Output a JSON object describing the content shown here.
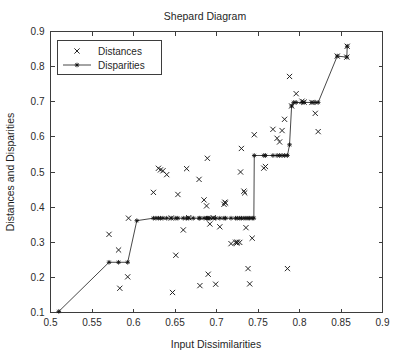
{
  "chart_data": {
    "type": "scatter",
    "title": "Shepard Diagram",
    "xlabel": "Input Dissimilarities",
    "ylabel": "Distances and Disparities",
    "xlim": [
      0.5,
      0.9
    ],
    "ylim": [
      0.1,
      0.9
    ],
    "xticks": [
      0.5,
      0.55,
      0.6,
      0.65,
      0.7,
      0.75,
      0.8,
      0.85,
      0.9
    ],
    "xtick_labels": [
      "0.5",
      "0.55",
      "0.6",
      "0.65",
      "0.7",
      "0.75",
      "0.8",
      "0.85",
      "0.9"
    ],
    "yticks": [
      0.1,
      0.2,
      0.3,
      0.4,
      0.5,
      0.6,
      0.7,
      0.8,
      0.9
    ],
    "ytick_labels": [
      "0.1",
      "0.2",
      "0.3",
      "0.4",
      "0.5",
      "0.6",
      "0.7",
      "0.8",
      "0.9"
    ],
    "grid": false,
    "legend_position": "upper-left",
    "series": [
      {
        "name": "Distances",
        "marker": "x",
        "style": "points",
        "points": [
          [
            0.5705,
            0.3225
          ],
          [
            0.582,
            0.278
          ],
          [
            0.5835,
            0.169
          ],
          [
            0.593,
            0.2015
          ],
          [
            0.594,
            0.3685
          ],
          [
            0.624,
            0.442
          ],
          [
            0.63,
            0.5105
          ],
          [
            0.6325,
            0.506
          ],
          [
            0.6355,
            0.5035
          ],
          [
            0.64,
            0.4925
          ],
          [
            0.6455,
            0.369
          ],
          [
            0.647,
            0.157
          ],
          [
            0.651,
            0.263
          ],
          [
            0.6535,
            0.436
          ],
          [
            0.66,
            0.335
          ],
          [
            0.664,
            0.5095
          ],
          [
            0.6665,
            0.37
          ],
          [
            0.679,
            0.479
          ],
          [
            0.68,
            0.1765
          ],
          [
            0.685,
            0.4205
          ],
          [
            0.688,
            0.4035
          ],
          [
            0.689,
            0.539
          ],
          [
            0.69,
            0.209
          ],
          [
            0.692,
            0.352
          ],
          [
            0.696,
            0.37
          ],
          [
            0.699,
            0.1805
          ],
          [
            0.704,
            0.344
          ],
          [
            0.709,
            0.408
          ],
          [
            0.71,
            0.414
          ],
          [
            0.711,
            0.4115
          ],
          [
            0.7175,
            0.296
          ],
          [
            0.723,
            0.3
          ],
          [
            0.7245,
            0.2975
          ],
          [
            0.725,
            0.3005
          ],
          [
            0.728,
            0.2995
          ],
          [
            0.729,
            0.5
          ],
          [
            0.73,
            0.567
          ],
          [
            0.733,
            0.4455
          ],
          [
            0.734,
            0.4405
          ],
          [
            0.7355,
            0.3415
          ],
          [
            0.738,
            0.225
          ],
          [
            0.74,
            0.1815
          ],
          [
            0.743,
            0.3115
          ],
          [
            0.7455,
            0.606
          ],
          [
            0.757,
            0.511
          ],
          [
            0.759,
            0.5155
          ],
          [
            0.768,
            0.6215
          ],
          [
            0.773,
            0.596
          ],
          [
            0.776,
            0.5855
          ],
          [
            0.779,
            0.618
          ],
          [
            0.782,
            0.65
          ],
          [
            0.7855,
            0.225
          ],
          [
            0.788,
            0.772
          ],
          [
            0.7905,
            0.688
          ],
          [
            0.796,
            0.723
          ],
          [
            0.803,
            0.7015
          ],
          [
            0.8055,
            0.699
          ],
          [
            0.815,
            0.698
          ],
          [
            0.819,
            0.667
          ],
          [
            0.8225,
            0.615
          ],
          [
            0.8455,
            0.83
          ],
          [
            0.857,
            0.827
          ],
          [
            0.8575,
            0.858
          ]
        ]
      },
      {
        "name": "Disparities",
        "marker": "star",
        "style": "line+points",
        "points": [
          [
            0.51,
            0.103
          ],
          [
            0.5705,
            0.243
          ],
          [
            0.582,
            0.243
          ],
          [
            0.593,
            0.243
          ],
          [
            0.604,
            0.3615
          ],
          [
            0.624,
            0.3685
          ],
          [
            0.627,
            0.3685
          ],
          [
            0.63,
            0.3685
          ],
          [
            0.6325,
            0.3685
          ],
          [
            0.6355,
            0.3685
          ],
          [
            0.64,
            0.3685
          ],
          [
            0.6455,
            0.3685
          ],
          [
            0.651,
            0.3685
          ],
          [
            0.6535,
            0.3685
          ],
          [
            0.66,
            0.3685
          ],
          [
            0.664,
            0.3685
          ],
          [
            0.6665,
            0.3685
          ],
          [
            0.672,
            0.3685
          ],
          [
            0.679,
            0.3685
          ],
          [
            0.68,
            0.3685
          ],
          [
            0.685,
            0.3685
          ],
          [
            0.688,
            0.3685
          ],
          [
            0.689,
            0.3685
          ],
          [
            0.69,
            0.3685
          ],
          [
            0.692,
            0.3685
          ],
          [
            0.696,
            0.3685
          ],
          [
            0.699,
            0.3685
          ],
          [
            0.704,
            0.3685
          ],
          [
            0.709,
            0.3685
          ],
          [
            0.711,
            0.3685
          ],
          [
            0.7175,
            0.3685
          ],
          [
            0.723,
            0.3685
          ],
          [
            0.725,
            0.3685
          ],
          [
            0.728,
            0.3685
          ],
          [
            0.73,
            0.3685
          ],
          [
            0.733,
            0.3685
          ],
          [
            0.7355,
            0.3685
          ],
          [
            0.738,
            0.3685
          ],
          [
            0.74,
            0.3685
          ],
          [
            0.743,
            0.3685
          ],
          [
            0.745,
            0.3685
          ],
          [
            0.7455,
            0.547
          ],
          [
            0.757,
            0.547
          ],
          [
            0.759,
            0.547
          ],
          [
            0.768,
            0.547
          ],
          [
            0.773,
            0.547
          ],
          [
            0.776,
            0.547
          ],
          [
            0.779,
            0.547
          ],
          [
            0.782,
            0.547
          ],
          [
            0.7855,
            0.547
          ],
          [
            0.788,
            0.5775
          ],
          [
            0.7905,
            0.688
          ],
          [
            0.793,
            0.698
          ],
          [
            0.796,
            0.698
          ],
          [
            0.803,
            0.698
          ],
          [
            0.8055,
            0.698
          ],
          [
            0.815,
            0.698
          ],
          [
            0.819,
            0.698
          ],
          [
            0.8225,
            0.698
          ],
          [
            0.8455,
            0.83
          ],
          [
            0.857,
            0.827
          ],
          [
            0.8575,
            0.858
          ]
        ]
      }
    ],
    "legend": [
      {
        "label": "Distances",
        "marker": "x",
        "has_line": false
      },
      {
        "label": "Disparities",
        "marker": "star",
        "has_line": true
      }
    ]
  },
  "colors": {
    "background": "#ffffff",
    "axis": "#3d3d3d",
    "text": "#1f1f1f",
    "marker": "#1a1a1a",
    "line": "#333333"
  }
}
